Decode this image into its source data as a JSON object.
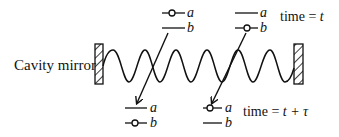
{
  "labels": {
    "mirror": "Cavity mirror",
    "time_top": "time = ",
    "time_top_var": "t",
    "time_bottom": "time = ",
    "time_bottom_var": "t + τ"
  },
  "atoms": {
    "top_left": {
      "upper": "a",
      "lower": "b",
      "occupied": "a"
    },
    "top_right": {
      "upper": "a",
      "lower": "b",
      "occupied": "b"
    },
    "bottom_left": {
      "upper": "a",
      "lower": "b",
      "occupied": "b"
    },
    "bottom_right": {
      "upper": "a",
      "lower": "b",
      "occupied": "a"
    }
  },
  "colors": {
    "ink": "#111111",
    "background": "#ffffff"
  }
}
